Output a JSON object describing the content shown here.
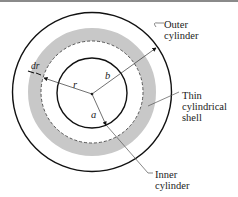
{
  "figure": {
    "labels": {
      "outer": [
        "Outer",
        "cylinder"
      ],
      "shell": [
        "Thin",
        "cylindrical",
        "shell"
      ],
      "inner": [
        "Inner",
        "cylinder"
      ],
      "r": "r",
      "b": "b",
      "a": "a",
      "dr": "dr"
    },
    "colors": {
      "stroke": "#111111",
      "shell_fill": "#c8c8c8",
      "leader": "#555555"
    }
  }
}
